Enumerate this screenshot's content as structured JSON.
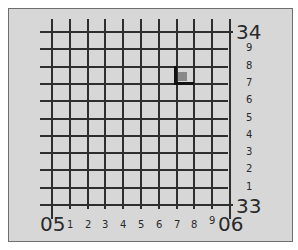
{
  "diagram": {
    "type": "grid-reference-diagram",
    "easting": {
      "start_label": "05",
      "end_label": "06",
      "subdivisions": [
        "1",
        "2",
        "3",
        "4",
        "5",
        "6",
        "7",
        "8",
        "9"
      ]
    },
    "northing": {
      "top_label": "34",
      "bottom_label": "33",
      "subdivisions": [
        "9",
        "8",
        "7",
        "6",
        "5",
        "4",
        "3",
        "2",
        "1"
      ]
    },
    "marker": {
      "shape": "L-corner-with-square",
      "easting_tenth": 7,
      "northing_tenth": 7,
      "corner_color": "#111111",
      "square_color": "#8a8a8a"
    },
    "colors": {
      "background": "#d7d7d7",
      "grid_line": "#2e2e2e",
      "frame_border": "#6e6e6e"
    }
  }
}
